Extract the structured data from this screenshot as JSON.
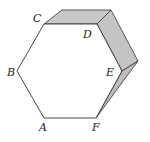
{
  "diagram": {
    "type": "hexagon-with-folded-faces",
    "vertices": [
      "A",
      "B",
      "C",
      "D",
      "E",
      "F"
    ],
    "labels": {
      "A": "A",
      "B": "B",
      "C": "C",
      "D": "D",
      "E": "E",
      "F": "F"
    },
    "shaded_faces": [
      "CD",
      "DE",
      "EF"
    ],
    "colors": {
      "stroke": "#333333",
      "shade": "#c8c8c8",
      "shade_dark": "#bdbdbd",
      "background": "#ffffff"
    }
  }
}
